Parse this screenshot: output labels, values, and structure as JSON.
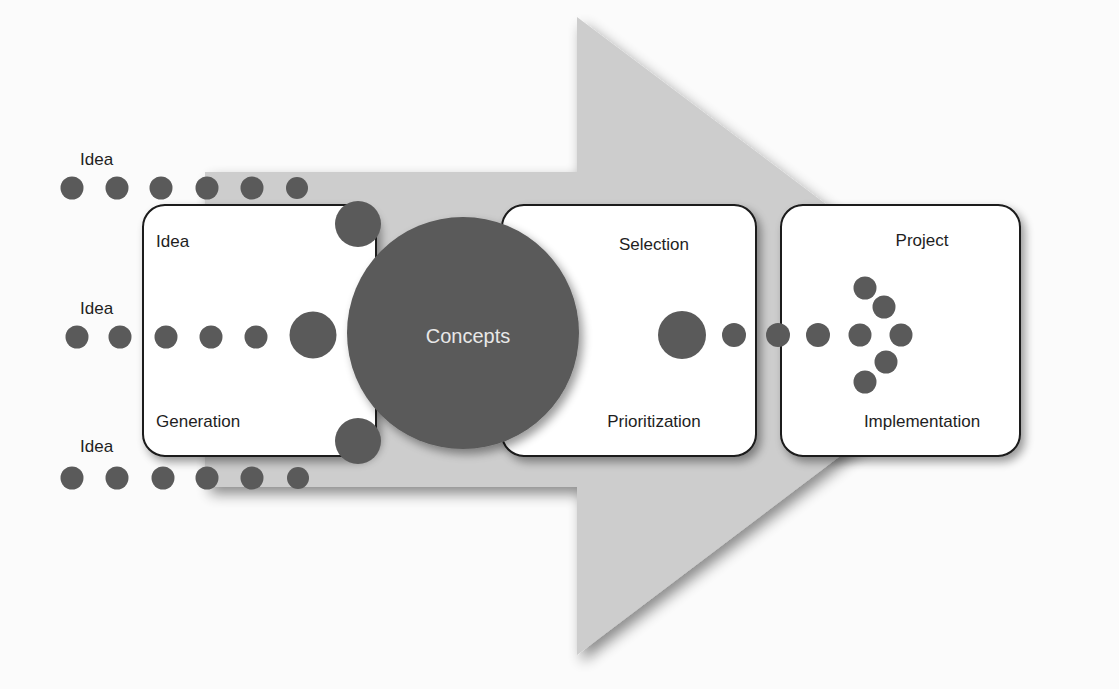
{
  "diagram": {
    "type": "process-flow",
    "colors": {
      "dot": "#5a5a5a",
      "arrow": "#cdcdcd",
      "box_fill": "#ffffff",
      "box_stroke": "#1a1a1a",
      "concepts_text": "#e8e8e8"
    },
    "input_labels": [
      "Idea",
      "Idea",
      "Idea"
    ],
    "stages": [
      {
        "top_label": "Idea",
        "bottom_label": "Generation"
      },
      {
        "top_label": "Selection",
        "bottom_label": "Prioritization"
      },
      {
        "top_label": "Project",
        "bottom_label": "Implementation"
      }
    ],
    "center_label": "Concepts"
  }
}
